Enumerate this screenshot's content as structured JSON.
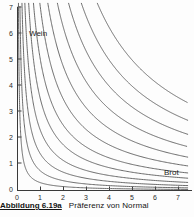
{
  "figure": {
    "caption_number": "Abbildung 6.19a",
    "caption_text": "Präferenz von Normal"
  },
  "labels": {
    "wein": "Wein",
    "brot": "Brot"
  },
  "axes": {
    "x_ticks": [
      "0",
      "1",
      "2",
      "3",
      "4",
      "5",
      "6",
      "7"
    ],
    "y_ticks": [
      "0",
      "1",
      "2",
      "3",
      "4",
      "5",
      "6",
      "7"
    ]
  },
  "chart_data": {
    "type": "line",
    "xlabel": "Brot",
    "ylabel": "Wein",
    "xlim": [
      0,
      7.4
    ],
    "ylim": [
      0,
      7.2
    ],
    "grid": false,
    "legend": "none",
    "annotations": [
      {
        "text": "Wein",
        "x": 0.55,
        "y": 6.15
      },
      {
        "text": "Brot",
        "x": 6.45,
        "y": 0.8
      }
    ],
    "curve_family": "indifference curves, hyperbolas of form y = k / x",
    "series": [
      {
        "name": "k = 0.30",
        "k": 0.3
      },
      {
        "name": "k = 0.75",
        "k": 0.75
      },
      {
        "name": "k = 1.40",
        "k": 1.4
      },
      {
        "name": "k = 2.30",
        "k": 2.3
      },
      {
        "name": "k = 3.50",
        "k": 3.5
      },
      {
        "name": "k = 5.00",
        "k": 5.0
      },
      {
        "name": "k = 7.00",
        "k": 7.0
      },
      {
        "name": "k = 9.50",
        "k": 9.5
      },
      {
        "name": "k = 12.50",
        "k": 12.5
      },
      {
        "name": "k = 16.00",
        "k": 16.0
      },
      {
        "name": "k = 20.00",
        "k": 20.0
      },
      {
        "name": "k = 25.00",
        "k": 25.0
      }
    ]
  }
}
